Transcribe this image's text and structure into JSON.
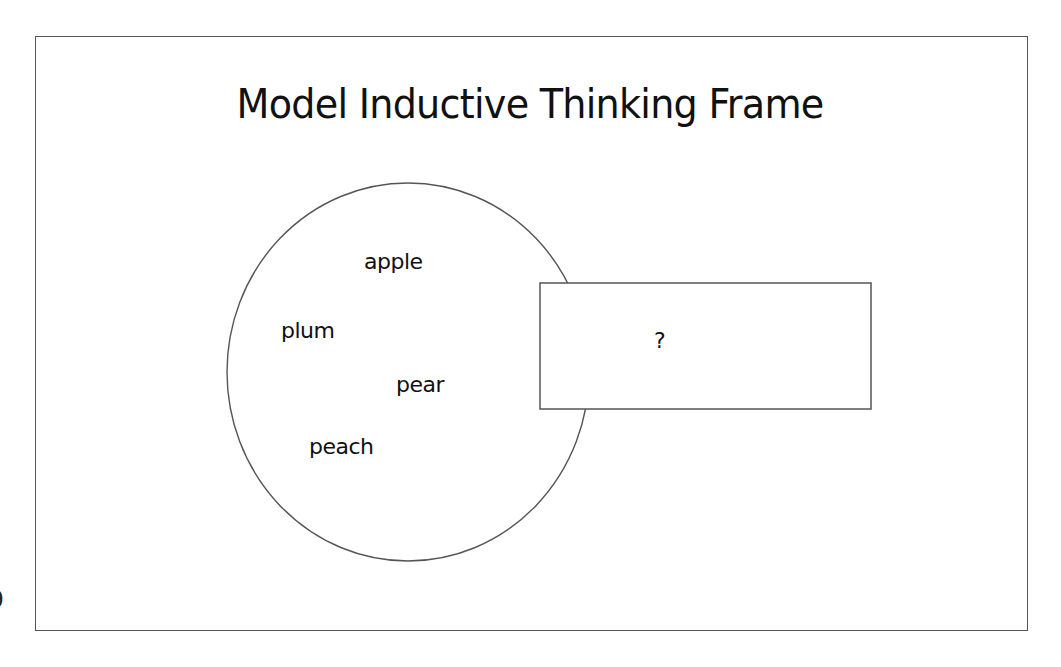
{
  "page": {
    "page_number_fragment": "9"
  },
  "slide": {
    "title": "Model Inductive Thinking Frame",
    "circle": {
      "label": "examples",
      "items": [
        {
          "text": "apple"
        },
        {
          "text": "plum"
        },
        {
          "text": "pear"
        },
        {
          "text": "peach"
        }
      ]
    },
    "box": {
      "text": "?"
    }
  },
  "colors": {
    "stroke": "#555555",
    "text": "#111111",
    "background": "#ffffff"
  }
}
